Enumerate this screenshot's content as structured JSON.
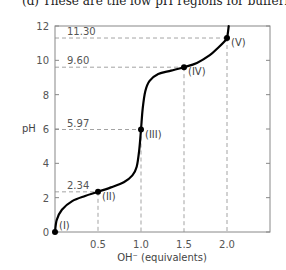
{
  "caption": "(d) These are the low pH regions for buffering pow",
  "chart_data": {
    "type": "line",
    "title": "",
    "xlabel": "OH⁻ (equivalents)",
    "ylabel": "pH",
    "xlim": [
      0,
      2.5
    ],
    "ylim": [
      0,
      12
    ],
    "x_ticks": [
      "0.5",
      "1.0",
      "1.5",
      "2.0"
    ],
    "x_tick_values": [
      0.5,
      1.0,
      1.5,
      2.0
    ],
    "y_ticks": [
      "0",
      "2",
      "4",
      "6",
      "8",
      "10",
      "12"
    ],
    "y_tick_values": [
      0,
      2,
      4,
      6,
      8,
      10,
      12
    ],
    "grid": false,
    "series": [
      {
        "name": "titration curve",
        "color": "#000000",
        "x": [
          0.0,
          0.02,
          0.08,
          0.2,
          0.35,
          0.5,
          0.65,
          0.8,
          0.9,
          0.95,
          0.98,
          1.0,
          1.02,
          1.05,
          1.1,
          1.2,
          1.35,
          1.5,
          1.65,
          1.8,
          1.9,
          1.97,
          2.0,
          2.02
        ],
        "y": [
          0.0,
          0.7,
          1.3,
          1.8,
          2.1,
          2.34,
          2.6,
          2.9,
          3.3,
          3.8,
          4.8,
          5.97,
          7.2,
          8.2,
          8.8,
          9.2,
          9.4,
          9.6,
          9.85,
          10.3,
          10.75,
          11.1,
          11.3,
          12.0
        ]
      }
    ],
    "points": [
      {
        "label": "(I)",
        "x": 0.0,
        "y": 0.0
      },
      {
        "label": "(II)",
        "x": 0.5,
        "y": 2.34
      },
      {
        "label": "(III)",
        "x": 1.0,
        "y": 5.97
      },
      {
        "label": "(IV)",
        "x": 1.5,
        "y": 9.6
      },
      {
        "label": "(V)",
        "x": 2.0,
        "y": 11.3
      }
    ],
    "reference_lines": [
      {
        "label": "2.34",
        "x": 0.5,
        "y": 2.34
      },
      {
        "label": "5.97",
        "x": 1.0,
        "y": 5.97
      },
      {
        "label": "9.60",
        "x": 1.5,
        "y": 9.6
      },
      {
        "label": "11.30",
        "x": 2.0,
        "y": 11.3
      }
    ]
  }
}
